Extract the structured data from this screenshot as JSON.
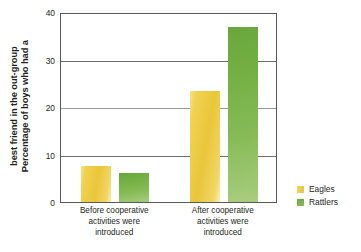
{
  "chart_data": {
    "type": "bar",
    "title": "",
    "xlabel": "",
    "ylabel_lines": [
      "Percentage of boys who had a",
      "best friend in the out-group"
    ],
    "ylabel": "Percentage of boys who had a best friend in the out-group",
    "categories": [
      "Before cooperative activities were introduced",
      "After cooperative activities were introduced"
    ],
    "category_lines": [
      [
        "Before cooperative",
        "activities were",
        "introduced"
      ],
      [
        "After cooperative",
        "activities were",
        "introduced"
      ]
    ],
    "series": [
      {
        "name": "Eagles",
        "color": "#EFD04A",
        "values": [
          7.5,
          23.4
        ]
      },
      {
        "name": "Rattlers",
        "color": "#7AB648",
        "values": [
          6.2,
          36.8
        ]
      }
    ],
    "ylim": [
      0,
      40
    ],
    "yticks": [
      0,
      10,
      20,
      30,
      40
    ],
    "ytick_labels": [
      "0",
      "10",
      "20",
      "30",
      "40"
    ],
    "grid": true,
    "grid_axis": "y",
    "legend_position": "right"
  },
  "legend": {
    "items": [
      {
        "label": "Eagles"
      },
      {
        "label": "Rattlers"
      }
    ]
  },
  "colors": {
    "eagles": "#EFD04A",
    "rattlers": "#7AB648",
    "axis": "#58595B",
    "grid": "#6D6E70",
    "text": "#231F20",
    "background": "#FFFFFF"
  }
}
